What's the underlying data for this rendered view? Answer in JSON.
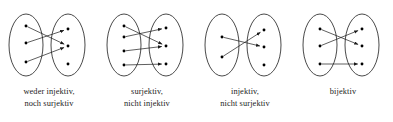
{
  "figure": {
    "stroke_color": "#1a1a1a",
    "dot_color": "#000000",
    "background_color": "#ffffff",
    "panel_width": 98,
    "panel_height": 122
  },
  "panels": [
    {
      "id": "panel-weder-injektiv-noch-surjektiv",
      "caption_lines": [
        "weder injektiv,",
        "noch surjektiv"
      ],
      "caption_full": "weder injektiv, noch surjektiv",
      "left_set": {
        "label": "domain",
        "dot_count": 3,
        "dots": [
          {
            "x": 26,
            "y": 24
          },
          {
            "x": 26,
            "y": 41
          },
          {
            "x": 26,
            "y": 60
          }
        ]
      },
      "right_set": {
        "label": "codomain",
        "dot_count": 3,
        "dots": [
          {
            "x": 68,
            "y": 27
          },
          {
            "x": 68,
            "y": 44
          },
          {
            "x": 68,
            "y": 62
          }
        ]
      },
      "arrows": [
        {
          "from": 0,
          "to": 1
        },
        {
          "from": 1,
          "to": 0
        },
        {
          "from": 2,
          "to": 1
        }
      ],
      "unhit_targets": [
        2
      ]
    },
    {
      "id": "panel-surjektiv-nicht-injektiv",
      "caption_lines": [
        "surjektiv,",
        "nicht injektiv"
      ],
      "caption_full": "surjektiv, nicht injektiv",
      "left_set": {
        "label": "domain",
        "dot_count": 4,
        "dots": [
          {
            "x": 26,
            "y": 24
          },
          {
            "x": 26,
            "y": 35
          },
          {
            "x": 26,
            "y": 49
          },
          {
            "x": 26,
            "y": 63
          }
        ]
      },
      "right_set": {
        "label": "codomain",
        "dot_count": 3,
        "dots": [
          {
            "x": 68,
            "y": 26
          },
          {
            "x": 68,
            "y": 44
          },
          {
            "x": 68,
            "y": 62
          }
        ]
      },
      "arrows": [
        {
          "from": 0,
          "to": 1
        },
        {
          "from": 1,
          "to": 0
        },
        {
          "from": 2,
          "to": 1
        },
        {
          "from": 3,
          "to": 2
        }
      ],
      "unhit_targets": []
    },
    {
      "id": "panel-injektiv-nicht-surjektiv",
      "caption_lines": [
        "injektiv,",
        "nicht surjektiv"
      ],
      "caption_full": "injektiv, nicht surjektiv",
      "left_set": {
        "label": "domain",
        "dot_count": 2,
        "dots": [
          {
            "x": 26,
            "y": 35
          },
          {
            "x": 26,
            "y": 55
          }
        ]
      },
      "right_set": {
        "label": "codomain",
        "dot_count": 3,
        "dots": [
          {
            "x": 68,
            "y": 28
          },
          {
            "x": 68,
            "y": 45
          },
          {
            "x": 68,
            "y": 63
          }
        ]
      },
      "arrows": [
        {
          "from": 0,
          "to": 1
        },
        {
          "from": 1,
          "to": 0
        }
      ],
      "unhit_targets": [
        2
      ]
    },
    {
      "id": "panel-bijektiv",
      "caption_lines": [
        "bijektiv"
      ],
      "caption_full": "bijektiv",
      "left_set": {
        "label": "domain",
        "dot_count": 3,
        "dots": [
          {
            "x": 26,
            "y": 27
          },
          {
            "x": 26,
            "y": 44
          },
          {
            "x": 26,
            "y": 62
          }
        ]
      },
      "right_set": {
        "label": "codomain",
        "dot_count": 3,
        "dots": [
          {
            "x": 68,
            "y": 27
          },
          {
            "x": 68,
            "y": 44
          },
          {
            "x": 68,
            "y": 62
          }
        ]
      },
      "arrows": [
        {
          "from": 0,
          "to": 1
        },
        {
          "from": 1,
          "to": 0
        },
        {
          "from": 2,
          "to": 2
        }
      ],
      "unhit_targets": []
    }
  ],
  "ellipse": {
    "left_cx": 26,
    "right_cx": 68,
    "cy": 43,
    "rx": 17,
    "ry": 31
  }
}
